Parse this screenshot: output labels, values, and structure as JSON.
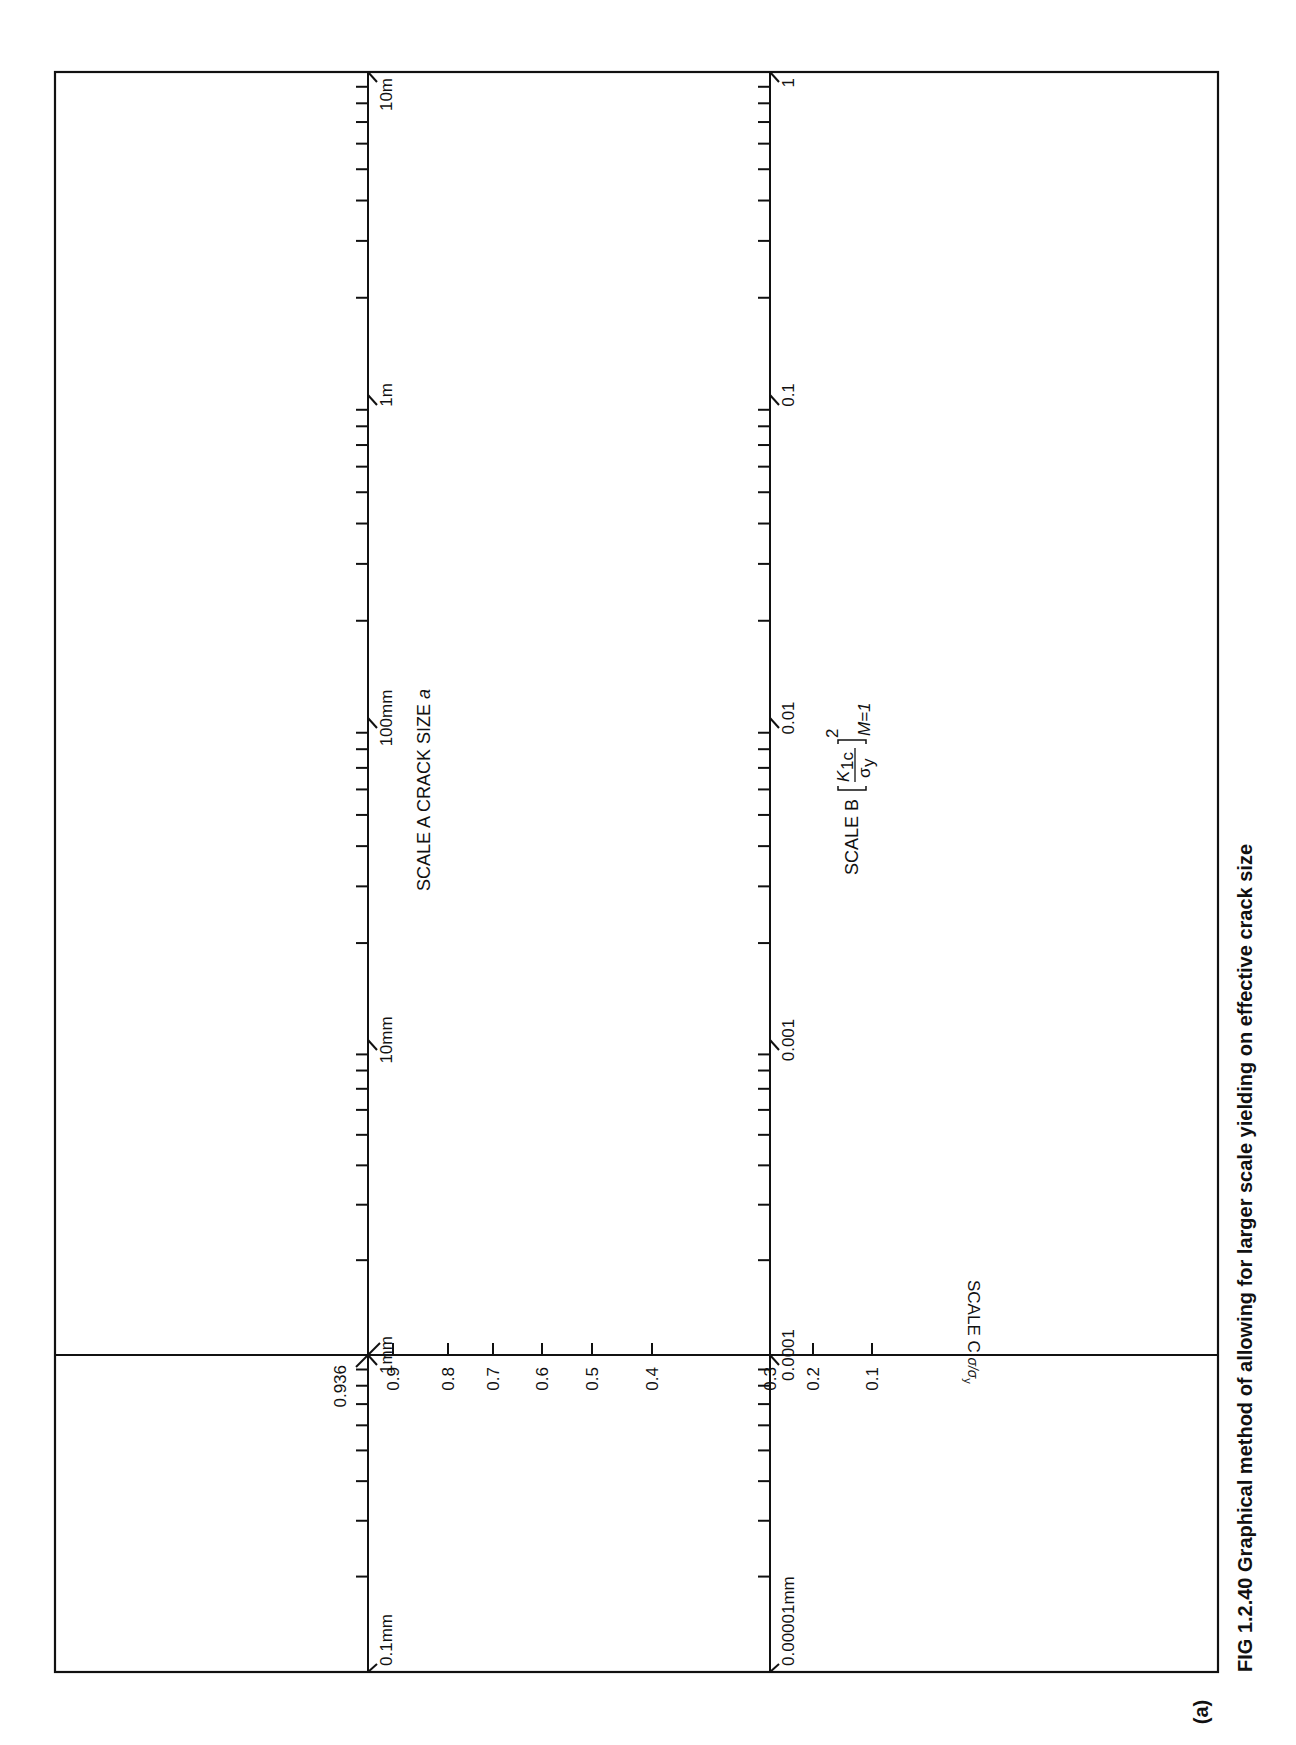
{
  "figure": {
    "panel_label": "(a)",
    "caption": "FIG 1.2.40 Graphical method of allowing for larger scale yielding on effective crack size",
    "line_color": "#111111",
    "background": "#ffffff"
  },
  "frame": {
    "left": 55,
    "top": 72,
    "right": 1218,
    "bottom": 1672
  },
  "scale_a": {
    "name": "SCALE A CRACK SIZE",
    "variable": "a",
    "axis_x": 368,
    "decades": [
      {
        "label": "10m",
        "y": 72
      },
      {
        "label": "1m",
        "y": 395
      },
      {
        "label": "100mm",
        "y": 718
      },
      {
        "label": "10mm",
        "y": 1040
      },
      {
        "label": "1mm",
        "y": 1355
      },
      {
        "label": "0.1mm",
        "y": 1672
      }
    ],
    "intersection_label": "0.936"
  },
  "scale_b": {
    "name": "SCALE B",
    "formula": {
      "numerator": "K",
      "numerator_sub": "1c",
      "denominator": "σ",
      "denominator_sub": "y",
      "power": "2",
      "condition": "M=1"
    },
    "axis_x": 770,
    "decades": [
      {
        "label": "1",
        "y": 72
      },
      {
        "label": "0.1",
        "y": 395
      },
      {
        "label": "0.01",
        "y": 718
      },
      {
        "label": "0.001",
        "y": 1040
      },
      {
        "label": "0.0001",
        "y": 1355
      },
      {
        "label": "0.00001mm",
        "y": 1672
      }
    ]
  },
  "scale_c": {
    "name": "SCALE C",
    "ratio": "σ/σ",
    "ratio_sub": "y",
    "axis_y": 1355,
    "ticks": [
      {
        "label": "0.9",
        "x": 393
      },
      {
        "label": "0.8",
        "x": 448
      },
      {
        "label": "0.7",
        "x": 493
      },
      {
        "label": "0.6",
        "x": 542
      },
      {
        "label": "0.5",
        "x": 592
      },
      {
        "label": "0.4",
        "x": 652
      },
      {
        "label": "0.3",
        "x": 770
      },
      {
        "label": "0.2",
        "x": 813
      },
      {
        "label": "0.1",
        "x": 872
      }
    ]
  }
}
